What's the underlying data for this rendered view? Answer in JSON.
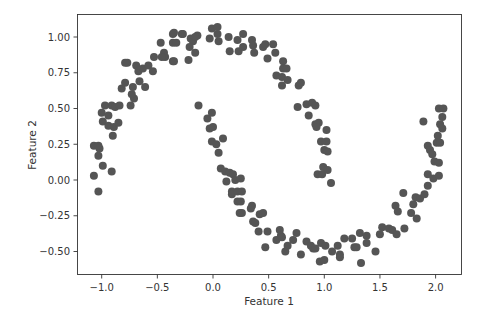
{
  "chart_data": {
    "type": "scatter",
    "title": "",
    "xlabel": "Feature 1",
    "ylabel": "Feature 2",
    "xlim": [
      -1.22,
      2.22
    ],
    "ylim": [
      -0.66,
      1.15
    ],
    "xticks": [
      -1.0,
      -0.5,
      0.0,
      0.5,
      1.0,
      1.5,
      2.0
    ],
    "xtick_labels": [
      "−1.0",
      "−0.5",
      "0.0",
      "0.5",
      "1.0",
      "1.5",
      "2.0"
    ],
    "yticks": [
      1.0,
      0.75,
      0.5,
      0.25,
      0.0,
      -0.25,
      -0.5
    ],
    "ytick_labels": [
      "1.00",
      "0.75",
      "0.50",
      "0.25",
      "0.00",
      "−0.25",
      "−0.50"
    ],
    "grid": false,
    "legend": null,
    "marker_color": "#555555",
    "marker_radius_px": 4,
    "points": [
      [
        -1.07,
        0.24
      ],
      [
        -1.03,
        0.24
      ],
      [
        -1.02,
        0.22
      ],
      [
        -1.03,
        0.17
      ],
      [
        -1.0,
        0.47
      ],
      [
        -0.94,
        0.45
      ],
      [
        -0.99,
        0.41
      ],
      [
        -0.94,
        0.38
      ],
      [
        -0.9,
        0.31
      ],
      [
        -0.89,
        0.37
      ],
      [
        -0.85,
        0.4
      ],
      [
        -0.91,
        0.52
      ],
      [
        -0.88,
        0.51
      ],
      [
        -0.84,
        0.52
      ],
      [
        -0.74,
        0.52
      ],
      [
        -0.82,
        0.64
      ],
      [
        -0.79,
        0.68
      ],
      [
        -0.72,
        0.65
      ],
      [
        -0.71,
        0.57
      ],
      [
        -0.73,
        0.6
      ],
      [
        -0.77,
        0.82
      ],
      [
        -0.69,
        0.8
      ],
      [
        -0.66,
        0.69
      ],
      [
        -0.67,
        0.76
      ],
      [
        -0.63,
        0.78
      ],
      [
        -0.58,
        0.8
      ],
      [
        -0.54,
        0.76
      ],
      [
        -0.53,
        0.86
      ],
      [
        -0.47,
        0.96
      ],
      [
        -0.44,
        0.89
      ],
      [
        -0.43,
        0.86
      ],
      [
        -0.36,
        0.83
      ],
      [
        -0.36,
        1.02
      ],
      [
        -0.36,
        0.96
      ],
      [
        -0.33,
        0.96
      ],
      [
        -0.28,
        1.02
      ],
      [
        -0.22,
        0.84
      ],
      [
        -0.2,
        0.99
      ],
      [
        -0.18,
        0.97
      ],
      [
        -0.16,
        0.89
      ],
      [
        -0.14,
        1.01
      ],
      [
        -0.01,
        1.06
      ],
      [
        0.04,
        1.07
      ],
      [
        -0.03,
        0.99
      ],
      [
        0.05,
        0.97
      ],
      [
        0.04,
        1.02
      ],
      [
        0.14,
        1.0
      ],
      [
        0.15,
        0.9
      ],
      [
        0.22,
        0.98
      ],
      [
        0.23,
        0.9
      ],
      [
        0.27,
        1.02
      ],
      [
        0.27,
        0.93
      ],
      [
        0.35,
        0.98
      ],
      [
        0.36,
        0.94
      ],
      [
        0.37,
        0.89
      ],
      [
        0.45,
        0.93
      ],
      [
        0.47,
        0.95
      ],
      [
        0.54,
        0.95
      ],
      [
        0.56,
        0.89
      ],
      [
        0.49,
        0.85
      ],
      [
        0.63,
        0.83
      ],
      [
        0.63,
        0.78
      ],
      [
        0.66,
        0.78
      ],
      [
        0.57,
        0.73
      ],
      [
        0.62,
        0.72
      ],
      [
        0.67,
        0.7
      ],
      [
        0.62,
        0.66
      ],
      [
        0.77,
        0.66
      ],
      [
        0.79,
        0.68
      ],
      [
        0.76,
        0.51
      ],
      [
        0.84,
        0.53
      ],
      [
        0.89,
        0.54
      ],
      [
        0.92,
        0.52
      ],
      [
        0.86,
        0.45
      ],
      [
        0.92,
        0.39
      ],
      [
        0.95,
        0.4
      ],
      [
        0.93,
        0.37
      ],
      [
        1.02,
        0.35
      ],
      [
        0.97,
        0.27
      ],
      [
        1.02,
        0.27
      ],
      [
        1.0,
        0.21
      ],
      [
        1.03,
        0.2
      ],
      [
        0.99,
        0.09
      ],
      [
        0.94,
        0.04
      ],
      [
        0.98,
        0.04
      ],
      [
        1.03,
        0.07
      ],
      [
        1.06,
        -0.02
      ],
      [
        -0.97,
        0.52
      ],
      [
        -1.07,
        0.03
      ],
      [
        -0.99,
        0.1
      ],
      [
        -0.91,
        0.06
      ],
      [
        -1.03,
        -0.08
      ],
      [
        -0.79,
        0.82
      ],
      [
        -0.61,
        0.65
      ],
      [
        -0.46,
        0.86
      ],
      [
        -0.35,
        1.03
      ],
      [
        -0.27,
        1.02
      ],
      [
        -0.16,
        1.0
      ],
      [
        -0.21,
        0.93
      ],
      [
        -0.35,
        0.83
      ],
      [
        -0.13,
        0.52
      ],
      [
        -0.05,
        0.43
      ],
      [
        -0.01,
        0.47
      ],
      [
        -0.03,
        0.36
      ],
      [
        0.0,
        0.37
      ],
      [
        -0.01,
        0.27
      ],
      [
        0.03,
        0.25
      ],
      [
        0.05,
        0.19
      ],
      [
        0.09,
        0.29
      ],
      [
        0.07,
        0.08
      ],
      [
        0.11,
        0.06
      ],
      [
        0.12,
        -0.01
      ],
      [
        0.15,
        0.05
      ],
      [
        0.18,
        0.04
      ],
      [
        0.2,
        0.0
      ],
      [
        0.17,
        -0.08
      ],
      [
        0.17,
        -0.1
      ],
      [
        0.22,
        -0.08
      ],
      [
        0.22,
        -0.15
      ],
      [
        0.24,
        -0.23
      ],
      [
        0.25,
        0.01
      ],
      [
        0.26,
        -0.08
      ],
      [
        0.25,
        -0.15
      ],
      [
        0.26,
        -0.23
      ],
      [
        0.35,
        -0.18
      ],
      [
        0.34,
        -0.2
      ],
      [
        0.36,
        -0.29
      ],
      [
        0.38,
        -0.3
      ],
      [
        0.42,
        -0.24
      ],
      [
        0.45,
        -0.23
      ],
      [
        0.41,
        -0.36
      ],
      [
        0.49,
        -0.36
      ],
      [
        0.47,
        -0.47
      ],
      [
        0.57,
        -0.42
      ],
      [
        0.6,
        -0.35
      ],
      [
        0.61,
        -0.39
      ],
      [
        0.62,
        -0.4
      ],
      [
        0.65,
        -0.5
      ],
      [
        0.67,
        -0.46
      ],
      [
        0.72,
        -0.42
      ],
      [
        0.75,
        -0.37
      ],
      [
        0.79,
        -0.52
      ],
      [
        0.84,
        -0.43
      ],
      [
        0.88,
        -0.46
      ],
      [
        0.9,
        -0.48
      ],
      [
        0.92,
        -0.48
      ],
      [
        0.96,
        -0.57
      ],
      [
        0.97,
        -0.44
      ],
      [
        1.01,
        -0.46
      ],
      [
        1.07,
        -0.5
      ],
      [
        1.12,
        -0.46
      ],
      [
        1.14,
        -0.52
      ],
      [
        1.14,
        -0.54
      ],
      [
        1.18,
        -0.41
      ],
      [
        1.25,
        -0.41
      ],
      [
        1.27,
        -0.47
      ],
      [
        1.29,
        -0.47
      ],
      [
        1.32,
        -0.37
      ],
      [
        1.33,
        -0.58
      ],
      [
        1.38,
        -0.39
      ],
      [
        1.38,
        -0.44
      ],
      [
        1.46,
        -0.5
      ],
      [
        1.5,
        -0.38
      ],
      [
        1.52,
        -0.33
      ],
      [
        1.58,
        -0.34
      ],
      [
        1.61,
        -0.35
      ],
      [
        1.65,
        -0.38
      ],
      [
        1.72,
        -0.34
      ],
      [
        1.64,
        -0.18
      ],
      [
        1.66,
        -0.22
      ],
      [
        1.71,
        -0.09
      ],
      [
        1.78,
        -0.23
      ],
      [
        1.83,
        -0.27
      ],
      [
        1.8,
        -0.17
      ],
      [
        1.82,
        -0.12
      ],
      [
        1.86,
        -0.13
      ],
      [
        1.9,
        -0.1
      ],
      [
        1.93,
        -0.04
      ],
      [
        1.93,
        0.04
      ],
      [
        1.98,
        0.01
      ],
      [
        2.03,
        0.03
      ],
      [
        1.99,
        0.13
      ],
      [
        2.03,
        0.12
      ],
      [
        1.89,
        0.41
      ],
      [
        2.03,
        0.5
      ],
      [
        2.07,
        0.5
      ],
      [
        2.06,
        0.44
      ],
      [
        2.04,
        0.39
      ],
      [
        2.06,
        0.36
      ],
      [
        2.02,
        0.31
      ],
      [
        2.01,
        0.26
      ],
      [
        2.04,
        0.26
      ],
      [
        1.93,
        0.24
      ],
      [
        1.95,
        0.21
      ],
      [
        1.97,
        0.18
      ],
      [
        1.0,
        -0.56
      ]
    ]
  }
}
